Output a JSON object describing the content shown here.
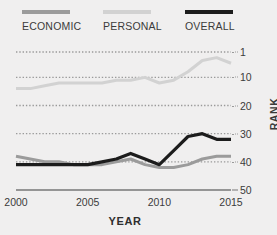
{
  "chart_data": {
    "type": "line",
    "title": "",
    "xlabel": "YEAR",
    "ylabel": "RANK",
    "xlim": [
      2000,
      2015
    ],
    "ylim": [
      1,
      50
    ],
    "y_inverted": true,
    "grid": "horizontal-dotted",
    "legend_position": "top",
    "xticks": [
      "2000",
      "2005",
      "2010",
      "2015"
    ],
    "xtick_values": [
      2000,
      2005,
      2010,
      2015
    ],
    "yticks": [
      "1",
      "10",
      "20",
      "30",
      "40",
      "50"
    ],
    "ytick_values": [
      1,
      10,
      20,
      30,
      40,
      50
    ],
    "x": [
      2000,
      2001,
      2002,
      2003,
      2004,
      2005,
      2006,
      2007,
      2008,
      2009,
      2010,
      2011,
      2012,
      2013,
      2014,
      2015
    ],
    "series": [
      {
        "name": "ECONOMIC",
        "color": "#9b9b9b",
        "values": [
          38,
          39,
          40,
          40,
          41,
          41,
          41,
          40,
          39,
          41,
          42,
          42,
          41,
          39,
          38,
          38
        ]
      },
      {
        "name": "PERSONAL",
        "color": "#d2d2d2",
        "values": [
          14,
          14,
          13,
          12,
          12,
          12,
          12,
          11,
          11,
          10,
          12,
          11,
          8,
          4,
          3,
          5
        ]
      },
      {
        "name": "OVERALL",
        "color": "#1c1c1c",
        "values": [
          41,
          41,
          41,
          41,
          41,
          41,
          40,
          39,
          37,
          39,
          41,
          36,
          31,
          30,
          32,
          32
        ]
      }
    ]
  },
  "legend": {
    "items": [
      {
        "label": "ECONOMIC",
        "color": "#9b9b9b",
        "icon": "line-swatch-icon"
      },
      {
        "label": "PERSONAL",
        "color": "#d2d2d2",
        "icon": "line-swatch-icon"
      },
      {
        "label": "OVERALL",
        "color": "#1c1c1c",
        "icon": "line-swatch-icon"
      }
    ]
  },
  "colors": {
    "background": "#f0efef",
    "text": "#3b3b3b",
    "gridline": "#9a9a9a",
    "baseline": "#777777"
  }
}
